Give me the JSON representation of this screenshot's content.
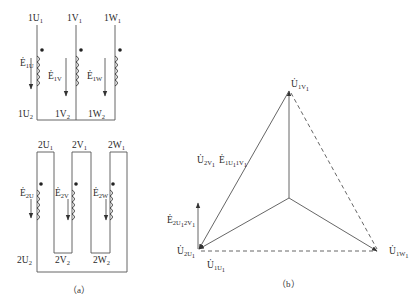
{
  "figure": {
    "part_a": {
      "caption": "（a）",
      "primary": {
        "top_terminals": [
          {
            "base": "1U",
            "sub": "1"
          },
          {
            "base": "1V",
            "sub": "1"
          },
          {
            "base": "1W",
            "sub": "1"
          }
        ],
        "bottom_terminals": [
          {
            "base": "1U",
            "sub": "2"
          },
          {
            "base": "1V",
            "sub": "2"
          },
          {
            "base": "1W",
            "sub": "2"
          }
        ],
        "emf_labels": [
          {
            "base": "Ė",
            "sub": "1U"
          },
          {
            "base": "Ė",
            "sub": "1V"
          },
          {
            "base": "Ė",
            "sub": "1W"
          }
        ],
        "connection": "star"
      },
      "secondary": {
        "top_terminals": [
          {
            "base": "2U",
            "sub": "1"
          },
          {
            "base": "2V",
            "sub": "1"
          },
          {
            "base": "2W",
            "sub": "1"
          }
        ],
        "bottom_terminals": [
          {
            "base": "2U",
            "sub": "2"
          },
          {
            "base": "2V",
            "sub": "2"
          },
          {
            "base": "2W",
            "sub": "2"
          }
        ],
        "emf_labels": [
          {
            "base": "Ė",
            "sub": "2U"
          },
          {
            "base": "Ė",
            "sub": "2V"
          },
          {
            "base": "Ė",
            "sub": "2W"
          }
        ],
        "connection": "delta"
      }
    },
    "part_b": {
      "caption": "（b）",
      "phasor_labels": {
        "top": {
          "base": "U̇",
          "sub": "1V",
          "sub2": "1"
        },
        "left_edge": {
          "text1": "U̇",
          "sub1": "2V",
          "sub1b": "1",
          "text2": "Ė",
          "sub2": "1U",
          "sub2b": "1",
          "sub2c": "1V",
          "sub2d": "1"
        },
        "emf_vertical": {
          "base": "Ė",
          "sub": "2U",
          "sub_b": "1",
          "sub_c": "2V",
          "sub_d": "1"
        },
        "bottom_left_a": {
          "base": "U̇",
          "sub": "2U",
          "sub2": "1"
        },
        "bottom_left_b": {
          "base": "U̇",
          "sub": "1U",
          "sub2": "1"
        },
        "right": {
          "base": "U̇",
          "sub": "1W",
          "sub2": "1"
        }
      }
    }
  }
}
